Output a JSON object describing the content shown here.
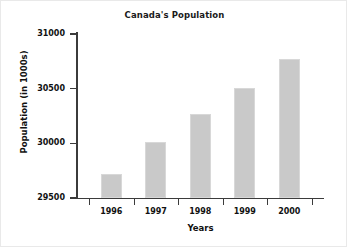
{
  "chart_data": {
    "type": "bar",
    "title": "Canada's Population",
    "xlabel": "Years",
    "ylabel": "Population (in 1000s)",
    "categories": [
      "1996",
      "1997",
      "1998",
      "1999",
      "2000"
    ],
    "values": [
      29720,
      30010,
      30270,
      30510,
      30770
    ],
    "ylim": [
      29500,
      31000
    ],
    "yticks": [
      29500,
      30000,
      30500,
      31000
    ],
    "ytick_labels": [
      "29500",
      "30000",
      "30500",
      "31000"
    ],
    "grid": false,
    "legend": false,
    "bar_color": "#c9c9c9",
    "axis_color": "#3b3b3b",
    "text_color": "#111111"
  }
}
